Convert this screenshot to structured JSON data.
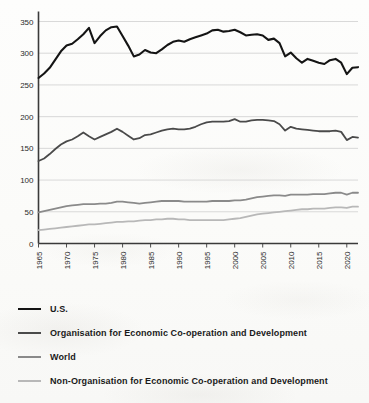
{
  "chart_data": {
    "type": "line",
    "title": "",
    "subtitle": "",
    "xlabel": "",
    "ylabel": "",
    "xlim": [
      1965,
      2022
    ],
    "ylim": [
      0,
      350
    ],
    "grid": true,
    "grid_axis": "y",
    "legend_position": "below",
    "y_ticks": [
      0,
      50,
      100,
      150,
      200,
      250,
      300,
      350
    ],
    "y_tick_labels": [
      "0",
      "50",
      "100",
      "150",
      "200",
      "250",
      "300",
      "350"
    ],
    "x_ticks": [
      1965,
      1970,
      1975,
      1980,
      1985,
      1990,
      1995,
      2000,
      2005,
      2010,
      2015,
      2020
    ],
    "x_tick_labels": [
      "1965",
      "1970",
      "1975",
      "1980",
      "1985",
      "1990",
      "1995",
      "2000",
      "2005",
      "2010",
      "2015",
      "2020"
    ],
    "x": [
      1965,
      1966,
      1967,
      1968,
      1969,
      1970,
      1971,
      1972,
      1973,
      1974,
      1975,
      1976,
      1977,
      1978,
      1979,
      1980,
      1981,
      1982,
      1983,
      1984,
      1985,
      1986,
      1987,
      1988,
      1989,
      1990,
      1991,
      1992,
      1993,
      1994,
      1995,
      1996,
      1997,
      1998,
      1999,
      2000,
      2001,
      2002,
      2003,
      2004,
      2005,
      2006,
      2007,
      2008,
      2009,
      2010,
      2011,
      2012,
      2013,
      2014,
      2015,
      2016,
      2017,
      2018,
      2019,
      2020,
      2021,
      2022
    ],
    "series": [
      {
        "name": "U.S.",
        "color": "#141414",
        "width": 2.1,
        "values": [
          261,
          268,
          277,
          290,
          303,
          312,
          315,
          322,
          330,
          340,
          316,
          327,
          336,
          341,
          342,
          327,
          312,
          295,
          298,
          305,
          301,
          300,
          306,
          313,
          318,
          320,
          318,
          322,
          325,
          328,
          331,
          336,
          337,
          334,
          335,
          337,
          333,
          328,
          329,
          330,
          328,
          321,
          323,
          316,
          295,
          301,
          292,
          285,
          291,
          288,
          285,
          283,
          289,
          291,
          285,
          267,
          277,
          278
        ]
      },
      {
        "name": "Organisation for Economic Co-operation and Development",
        "color": "#4a4a4a",
        "width": 1.8,
        "values": [
          130,
          134,
          141,
          149,
          156,
          161,
          164,
          169,
          175,
          169,
          164,
          168,
          172,
          176,
          181,
          176,
          170,
          164,
          166,
          171,
          172,
          175,
          178,
          180,
          181,
          180,
          180,
          181,
          184,
          188,
          191,
          192,
          192,
          192,
          193,
          196,
          192,
          192,
          194,
          195,
          195,
          194,
          193,
          188,
          178,
          184,
          181,
          180,
          179,
          178,
          177,
          177,
          177,
          178,
          176,
          163,
          168,
          167
        ]
      },
      {
        "name": "World",
        "color": "#8a8a8a",
        "width": 1.8,
        "values": [
          49,
          51,
          53,
          55,
          57,
          59,
          60,
          61,
          62,
          62,
          62,
          63,
          63,
          64,
          66,
          66,
          65,
          64,
          63,
          64,
          65,
          66,
          67,
          67,
          67,
          67,
          66,
          66,
          66,
          66,
          66,
          67,
          67,
          67,
          67,
          68,
          68,
          69,
          71,
          73,
          74,
          75,
          76,
          76,
          75,
          77,
          77,
          77,
          77,
          78,
          78,
          78,
          79,
          80,
          80,
          77,
          80,
          80
        ]
      },
      {
        "name": "Non-Organisation for Economic Co-operation and Development",
        "color": "#b8b8b8",
        "width": 1.8,
        "values": [
          21,
          22,
          23,
          24,
          25,
          26,
          27,
          28,
          29,
          30,
          30,
          31,
          32,
          33,
          34,
          34,
          35,
          35,
          36,
          37,
          37,
          38,
          38,
          39,
          39,
          38,
          38,
          37,
          37,
          37,
          37,
          37,
          37,
          37,
          38,
          39,
          40,
          42,
          44,
          46,
          47,
          48,
          49,
          50,
          51,
          52,
          53,
          54,
          54,
          55,
          55,
          55,
          56,
          57,
          57,
          56,
          58,
          58
        ]
      }
    ]
  },
  "legend": {
    "items": [
      {
        "label": "U.S.",
        "color": "#141414",
        "width": 2.6
      },
      {
        "label": "Organisation for Economic Co-operation and Development",
        "color": "#4a4a4a",
        "width": 2.1
      },
      {
        "label": "World",
        "color": "#8a8a8a",
        "width": 2.1
      },
      {
        "label": "Non-Organisation for Economic Co-operation and Development",
        "color": "#b8b8b8",
        "width": 2.1
      }
    ]
  },
  "axes": {
    "axis_color": "#3a3a3a",
    "grid_color": "#cfcfcf"
  }
}
